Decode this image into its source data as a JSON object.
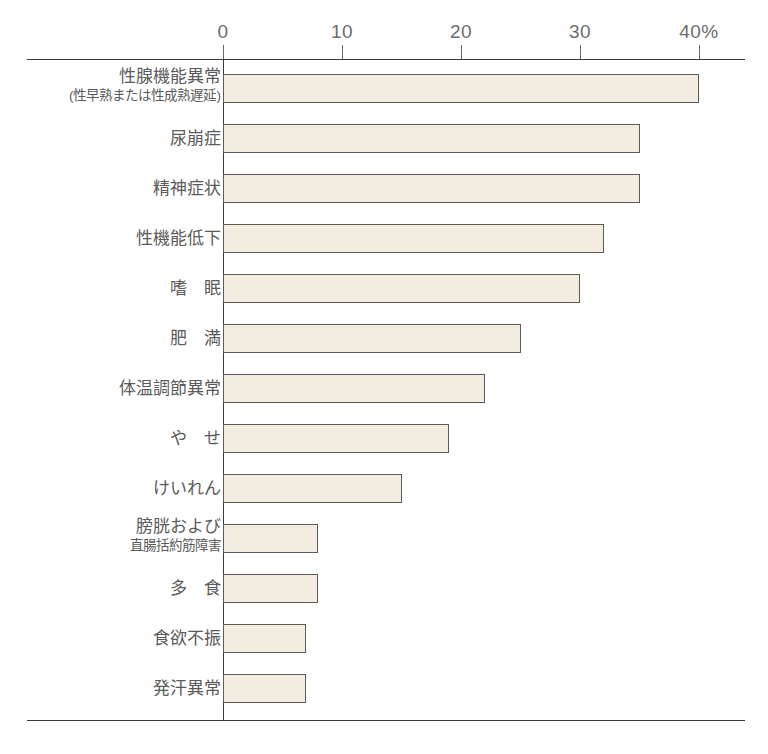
{
  "chart_data": {
    "type": "bar",
    "orientation": "horizontal",
    "title": "",
    "xlabel": "",
    "ylabel": "",
    "xlim": [
      0,
      40
    ],
    "grid": false,
    "legend": null,
    "axis_tick_labels": [
      "0",
      "10",
      "20",
      "30",
      "40%"
    ],
    "axis_ticks": [
      0,
      10,
      20,
      30,
      40
    ],
    "unit": "%",
    "categories": [
      "性腺機能異常",
      "尿崩症",
      "精神症状",
      "性機能低下",
      "嗜　眠",
      "肥　満",
      "体温調節異常",
      "や　せ",
      "けいれん",
      "膀胱および\n直腸括約筋障害",
      "多　食",
      "食欲不振",
      "発汗異常"
    ],
    "values": [
      40,
      35,
      35,
      32,
      30,
      25,
      22,
      19,
      15,
      8,
      8,
      7,
      7
    ]
  },
  "bars": [
    {
      "label": "性腺機能異常",
      "sublabel": "(性早熟または性成熟遅延)",
      "value": 40
    },
    {
      "label": "尿崩症",
      "sublabel": "",
      "value": 35
    },
    {
      "label": "精神症状",
      "sublabel": "",
      "value": 35
    },
    {
      "label": "性機能低下",
      "sublabel": "",
      "value": 32
    },
    {
      "label": "嗜　眠",
      "sublabel": "",
      "value": 30
    },
    {
      "label": "肥　満",
      "sublabel": "",
      "value": 25
    },
    {
      "label": "体温調節異常",
      "sublabel": "",
      "value": 22
    },
    {
      "label": "や　せ",
      "sublabel": "",
      "value": 19
    },
    {
      "label": "けいれん",
      "sublabel": "",
      "value": 15
    },
    {
      "label": "膀胱および",
      "sublabel": "直腸括約筋障害",
      "value": 8
    },
    {
      "label": "多　食",
      "sublabel": "",
      "value": 8
    },
    {
      "label": "食欲不振",
      "sublabel": "",
      "value": 7
    },
    {
      "label": "発汗異常",
      "sublabel": "",
      "value": 7
    }
  ],
  "axis": {
    "ticks": [
      {
        "label": "0",
        "value": 0
      },
      {
        "label": "10",
        "value": 10
      },
      {
        "label": "20",
        "value": 20
      },
      {
        "label": "30",
        "value": 30
      },
      {
        "label": "40%",
        "value": 40
      }
    ]
  },
  "colors": {
    "bar_fill": "#f3ece0",
    "bar_stroke": "#5f5a52",
    "axis": "#3b3b3b",
    "text": "#5b5b5b",
    "background": "#ffffff"
  }
}
